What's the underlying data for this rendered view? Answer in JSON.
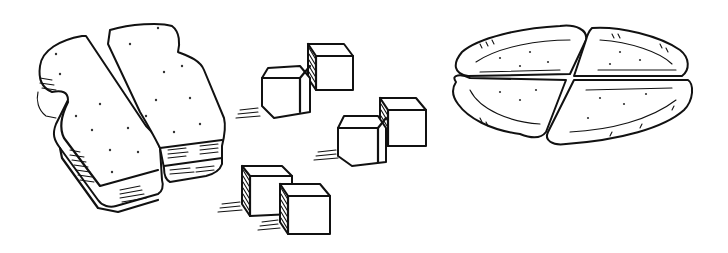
{
  "illustration": {
    "description": "Black and white line drawing of foods cut into fractions",
    "background": "#ffffff",
    "ink_color": "#111111",
    "groups": [
      {
        "name": "sandwich",
        "label": "Sandwich cut into two halves",
        "pieces": 2
      },
      {
        "name": "cubes",
        "label": "Six cubes arranged in three pairs",
        "pieces": 6
      },
      {
        "name": "pie",
        "label": "Flat round bread cut into four quarters",
        "pieces": 4
      }
    ]
  }
}
